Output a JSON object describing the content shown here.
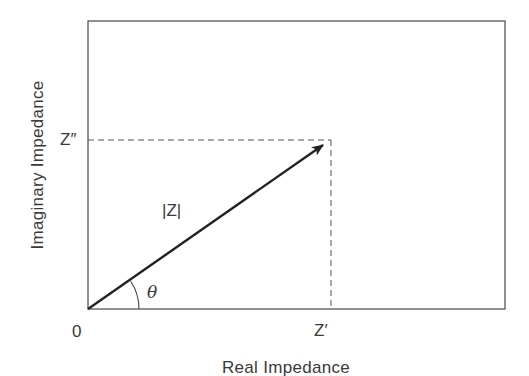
{
  "diagram": {
    "type": "impedance-phasor-diagram",
    "axes": {
      "x_label": "Real Impedance",
      "y_label": "Imaginary Impedance",
      "origin_label": "0"
    },
    "labels": {
      "real_component": "Z′",
      "imaginary_component": "Z″",
      "magnitude": "|Z|",
      "phase_angle": "θ"
    },
    "geometry": {
      "frame": {
        "x1": 88,
        "y1": 21,
        "x2": 505,
        "y2": 309
      },
      "origin": {
        "x": 88,
        "y": 309
      },
      "vector_tip": {
        "x": 323,
        "y": 145
      },
      "z_real_x": 331,
      "z_imag_y": 140,
      "angle_arc_radius": 51
    },
    "colors": {
      "line": "#2a2a2a",
      "frame": "#555555",
      "dashed": "#555555",
      "text": "#3a3a3a"
    }
  }
}
